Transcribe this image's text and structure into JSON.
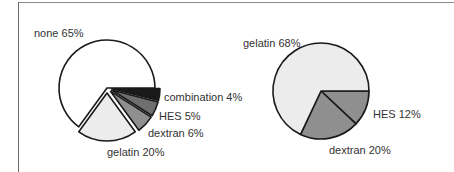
{
  "chart_data": [
    {
      "type": "pie",
      "title": "",
      "exploded": [
        "combination",
        "HES",
        "dextran",
        "gelatin"
      ],
      "categories": [
        "none",
        "gelatin",
        "dextran",
        "HES",
        "combination"
      ],
      "values": [
        65,
        20,
        6,
        5,
        4
      ],
      "labels": [
        "none 65%",
        "gelatin 20%",
        "dextran 6%",
        "HES  5%",
        "combination  4%"
      ],
      "colors": [
        "#ffffff",
        "#ececec",
        "#8f8f8f",
        "#6f6f6f",
        "#1a1a1a"
      ]
    },
    {
      "type": "pie",
      "title": "",
      "categories": [
        "gelatin",
        "dextran",
        "HES"
      ],
      "values": [
        68,
        20,
        12
      ],
      "labels": [
        "gelatin 68%",
        "dextran 20%",
        "HES  12%"
      ],
      "colors": [
        "#ececec",
        "#8f8f8f",
        "#8f8f8f"
      ]
    }
  ]
}
